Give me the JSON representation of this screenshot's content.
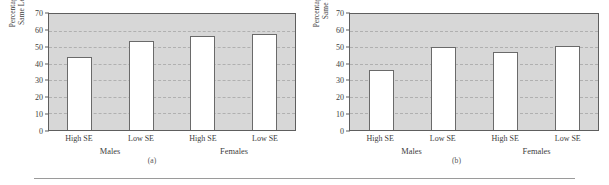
{
  "figure": {
    "background_color": "#ffffff",
    "plot_background_color": "#d7d7d7",
    "bar_fill_color": "#ffffff",
    "bar_edge_color": "#6a6a6a",
    "axis_color": "#5e5e5e",
    "gridline_color": "#b0b0b0"
  },
  "chart_data": [
    {
      "type": "bar",
      "panel_label": "(a)",
      "title": "",
      "ylabel": "Percentage of Other Students with Same Level of Academic Ability",
      "xlabel": "",
      "categories": [
        "High SE",
        "Low SE",
        "High SE",
        "Low SE"
      ],
      "groups": [
        "Males",
        "Females"
      ],
      "group_spans": [
        2,
        2
      ],
      "values": [
        44,
        54,
        57,
        58
      ],
      "ylim": [
        0,
        70
      ],
      "yticks": [
        0,
        10,
        20,
        30,
        40,
        50,
        60,
        70
      ],
      "ytick_labels": [
        "0",
        "10",
        "20",
        "30",
        "40",
        "50",
        "60",
        "70"
      ],
      "grid": true,
      "legend": "none"
    },
    {
      "type": "bar",
      "panel_label": "(b)",
      "title": "",
      "ylabel": "Percentage of Other Students with Same Level of Social Ability",
      "xlabel": "",
      "categories": [
        "High SE",
        "Low SE",
        "High SE",
        "Low SE"
      ],
      "groups": [
        "Males",
        "Females"
      ],
      "group_spans": [
        2,
        2
      ],
      "values": [
        36,
        50,
        47,
        51
      ],
      "ylim": [
        0,
        70
      ],
      "yticks": [
        0,
        10,
        20,
        30,
        40,
        50,
        60,
        70
      ],
      "ytick_labels": [
        "0",
        "10",
        "20",
        "30",
        "40",
        "50",
        "60",
        "70"
      ],
      "grid": true,
      "legend": "none"
    }
  ]
}
